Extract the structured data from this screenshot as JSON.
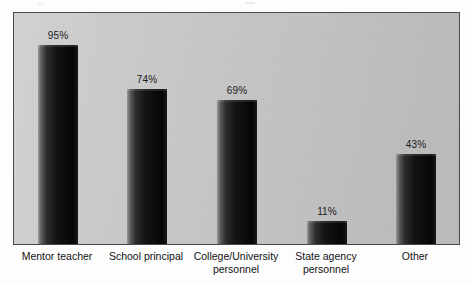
{
  "chart_data": {
    "type": "bar",
    "title": "",
    "subtitle": "",
    "xlabel": "",
    "ylabel": "",
    "ylim": [
      0,
      100
    ],
    "grid": false,
    "legend": false,
    "value_suffix": "%",
    "categories": [
      "Mentor teacher",
      "School principal",
      "College/University\npersonnel",
      "State agency\npersonnel",
      "Other"
    ],
    "values": [
      95,
      74,
      69,
      11,
      43
    ],
    "value_labels": [
      "95%",
      "74%",
      "69%",
      "11%",
      "43%"
    ],
    "bars": [
      {
        "category": "Mentor teacher",
        "value": 95,
        "label": "95%"
      },
      {
        "category": "School principal",
        "value": 74,
        "label": "74%"
      },
      {
        "category": "College/University personnel",
        "value": 69,
        "label": "69%"
      },
      {
        "category": "State agency personnel",
        "value": 11,
        "label": "11%"
      },
      {
        "category": "Other",
        "value": 43,
        "label": "43%"
      }
    ],
    "colors": {
      "bar_dark": "#0c0c0c",
      "bar_highlight": "#9a9a9a",
      "plot_background": "#cacaca",
      "frame": "#4a4a4a",
      "text": "#121212",
      "page_background": "#ffffff"
    }
  }
}
